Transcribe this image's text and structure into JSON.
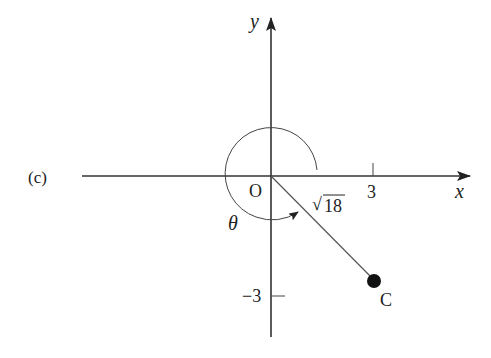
{
  "figure": {
    "part_label": "(c)",
    "axes": {
      "x_label": "x",
      "y_label": "y",
      "origin_label": "O"
    },
    "ticks": {
      "x_tick": "3",
      "y_tick": "−3"
    },
    "segment_label": "√18",
    "sqrt_symbol": "√",
    "sqrt_radicand": "18",
    "angle_label": "θ",
    "point_label": "C",
    "point": {
      "x": 3,
      "y": -3
    },
    "colors": {
      "ink": "#222222",
      "segment": "#555555",
      "background": "#ffffff"
    }
  }
}
